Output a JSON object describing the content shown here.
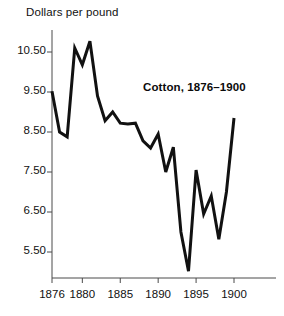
{
  "chart_data": {
    "type": "line",
    "title": "Dollars per pound",
    "xlabel": "",
    "ylabel": "Dollars per pound",
    "annotation": "Cotton, 1876–1900",
    "grid": false,
    "legend": "none",
    "xlim": [
      1876,
      1900
    ],
    "ylim": [
      4.9,
      10.9
    ],
    "yticks": [
      5.5,
      6.5,
      7.5,
      8.5,
      9.5,
      10.5
    ],
    "ytick_labels": [
      "5.50",
      "6.50",
      "7.50",
      "8.50",
      "9.50",
      "10.50"
    ],
    "xticks": [
      1876,
      1880,
      1885,
      1890,
      1895,
      1900
    ],
    "xtick_labels": [
      "1876",
      "1880",
      "1885",
      "1890",
      "1895",
      "1900"
    ],
    "series_name": "Cotton price",
    "line_color": "#111111",
    "x": [
      1876,
      1877,
      1878,
      1879,
      1880,
      1881,
      1882,
      1883,
      1884,
      1885,
      1886,
      1887,
      1888,
      1889,
      1890,
      1891,
      1892,
      1893,
      1894,
      1895,
      1896,
      1897,
      1898,
      1899,
      1900
    ],
    "values": [
      9.52,
      8.5,
      8.38,
      10.6,
      10.18,
      10.77,
      9.4,
      8.78,
      9.0,
      8.72,
      8.7,
      8.72,
      8.28,
      8.1,
      8.45,
      7.5,
      8.12,
      6.0,
      5.02,
      7.55,
      6.45,
      6.9,
      5.82,
      7.0,
      8.85
    ]
  },
  "axes": {
    "axis_color": "#4a4a4a",
    "tick_color": "#4a4a4a"
  }
}
